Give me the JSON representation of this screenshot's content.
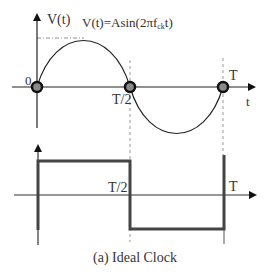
{
  "figure": {
    "caption": "(a) Ideal Clock",
    "colors": {
      "line": "#222222",
      "dashed": "#999999",
      "marker_fill": "#888888",
      "marker_stroke": "#1a1a1a",
      "text": "#333333"
    }
  },
  "sine_plot": {
    "y_axis_label": "V(t)",
    "x_axis_label": "t",
    "equation_prefix": "V(t)=Asin(2πf",
    "equation_subscript": "ck",
    "equation_suffix": "t)",
    "origin_label": "0",
    "half_period_label": "T/2",
    "period_label": "T"
  },
  "square_plot": {
    "half_period_label": "T/2",
    "period_label": "T"
  }
}
